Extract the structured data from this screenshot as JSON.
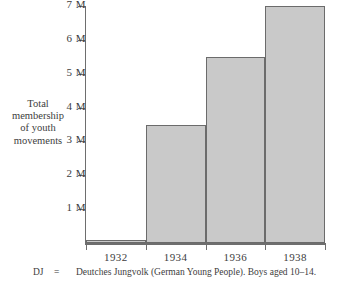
{
  "chart_data": {
    "type": "bar",
    "title": "",
    "xlabel": "",
    "ylabel": "Total membership of youth movements",
    "categories": [
      "1932",
      "1934",
      "1936",
      "1938"
    ],
    "values": [
      0.1,
      3.5,
      5.5,
      7.0
    ],
    "ylim": [
      0,
      7
    ],
    "ytick_values": [
      1,
      2,
      3,
      4,
      5,
      6,
      7
    ],
    "ytick_labels": [
      "1 M",
      "2 M",
      "3 M",
      "4 M",
      "5 M",
      "6 M",
      "7 M"
    ],
    "grid": false,
    "legend": "none",
    "bar_fill_color": "#c9c9c9",
    "bar_border_color": "#6b6b6b",
    "axis_color": "#6e6e6e",
    "text_color": "#3d3d3d",
    "units": "millions of members",
    "annotations": []
  },
  "ylabel_lines": [
    "Total",
    "membership",
    "of  youth",
    "movements"
  ],
  "caption": {
    "key": "DJ",
    "equals": "=",
    "text": "Deutches Jungvolk (German Young People). Boys aged 10–14."
  }
}
